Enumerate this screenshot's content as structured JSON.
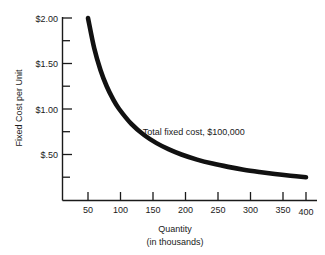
{
  "chart_data": {
    "type": "line",
    "title": "",
    "subtitle": "",
    "xlabel": "Quantity",
    "xlabel_sub": "(in thousands)",
    "ylabel": "Fixed Cost per Unit",
    "xlim": [
      0,
      420
    ],
    "ylim": [
      0,
      2.1
    ],
    "grid": false,
    "legend": "none",
    "x_ticks": [
      50,
      100,
      150,
      200,
      250,
      300,
      350,
      400
    ],
    "x_tick_labels": [
      "50",
      "100",
      "150",
      "200",
      "250",
      "300",
      "350",
      "400"
    ],
    "y_ticks": [
      0.25,
      0.5,
      0.75,
      1.0,
      1.25,
      1.5,
      1.75,
      2.0
    ],
    "y_tick_labels": [
      "",
      "$.50",
      "",
      "$1.00",
      "",
      "$1.50",
      "",
      "$2.00"
    ],
    "y_major_ticks": [
      0.5,
      1.0,
      1.5,
      2.0
    ],
    "y_minor_ticks": [
      0.25,
      0.75,
      1.25,
      1.75
    ],
    "annotations": [
      {
        "text": "Total fixed cost, $100,000",
        "x": 215,
        "y": 0.72
      }
    ],
    "series": [
      {
        "name": "Fixed cost per unit",
        "formula": "y = 100000 / (x * 1000)",
        "x": [
          50,
          60,
          70,
          80,
          90,
          100,
          120,
          140,
          160,
          180,
          200,
          225,
          250,
          275,
          300,
          325,
          350,
          375,
          400
        ],
        "values": [
          2.0,
          1.667,
          1.429,
          1.25,
          1.111,
          1.0,
          0.833,
          0.714,
          0.625,
          0.556,
          0.5,
          0.444,
          0.4,
          0.364,
          0.333,
          0.308,
          0.286,
          0.267,
          0.25
        ]
      }
    ]
  },
  "axis": {
    "y_label_2_00": "$2.00",
    "y_label_1_50": "$1.50",
    "y_label_1_00": "$1.00",
    "y_label_0_50": "$.50",
    "x_label_50": "50",
    "x_label_100": "100",
    "x_label_150": "150",
    "x_label_200": "200",
    "x_label_250": "250",
    "x_label_300": "300",
    "x_label_350": "350",
    "x_label_400": "400",
    "y_title": "Fixed Cost per Unit",
    "x_title": "Quantity",
    "x_title_sub": "(in thousands)"
  },
  "annotation": {
    "curve_note": "Total fixed cost, $100,000"
  },
  "colors": {
    "background": "#ffffff",
    "ink": "#1a1a1a",
    "curve": "#111111"
  }
}
